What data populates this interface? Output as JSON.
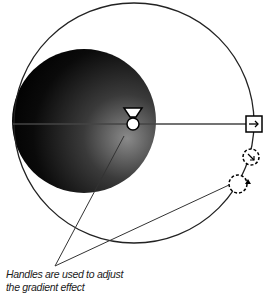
{
  "figure": {
    "caption_line1": "Handles are used to adjust",
    "caption_line2": "the gradient effect",
    "gradient_fill": {
      "center_color": "#8a8a8a",
      "edge_color": "#000000"
    },
    "handles": [
      {
        "name": "focal-point-handle",
        "shape": "triangle-over-circle"
      },
      {
        "name": "width-handle",
        "shape": "square-with-arrow",
        "glyph": "→"
      },
      {
        "name": "size-handle",
        "shape": "dashed-circle-with-arrow",
        "glyph": "↘"
      },
      {
        "name": "rotation-handle",
        "shape": "dashed-circle-with-triangle"
      }
    ]
  }
}
